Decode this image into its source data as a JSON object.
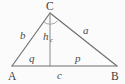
{
  "figure": {
    "name": "right-triangle-with-altitude",
    "background_color": "#fbfbfb",
    "stroke_color": "#6e6e6e",
    "label_color": "#4a4a4a"
  },
  "vertices": [
    {
      "id": "A",
      "label": "A",
      "x": 12,
      "y": 66
    },
    {
      "id": "B",
      "label": "B",
      "x": 117,
      "y": 66
    },
    {
      "id": "C",
      "label": "C",
      "x": 50,
      "y": 13
    }
  ],
  "foot": {
    "id": "F",
    "x": 50,
    "y": 66
  },
  "edges": [
    {
      "id": "b",
      "label": "b",
      "from": "A",
      "to": "C"
    },
    {
      "id": "a",
      "label": "a",
      "from": "C",
      "to": "B"
    },
    {
      "id": "c",
      "label": "c",
      "from": "A",
      "to": "B"
    }
  ],
  "altitude": {
    "id": "hc",
    "label": "h",
    "subscript": "c",
    "from": "C",
    "to": "F"
  },
  "segments": [
    {
      "id": "q",
      "label": "q",
      "from": "A",
      "to": "F"
    },
    {
      "id": "p",
      "label": "p",
      "from": "F",
      "to": "B"
    }
  ],
  "angle_marker": {
    "id": "right-angle-at-C",
    "at": "C",
    "label": ""
  },
  "label_positions": {
    "C": {
      "x": 46,
      "y": 10
    },
    "A": {
      "x": 8,
      "y": 80
    },
    "B": {
      "x": 112,
      "y": 80
    },
    "b": {
      "x": 21,
      "y": 38
    },
    "a": {
      "x": 84,
      "y": 34
    },
    "h": {
      "x": 44,
      "y": 39
    },
    "h_sub": {
      "x": 51,
      "y": 41
    },
    "q": {
      "x": 30,
      "y": 61
    },
    "p": {
      "x": 76,
      "y": 61
    },
    "c": {
      "x": 58,
      "y": 79
    }
  }
}
